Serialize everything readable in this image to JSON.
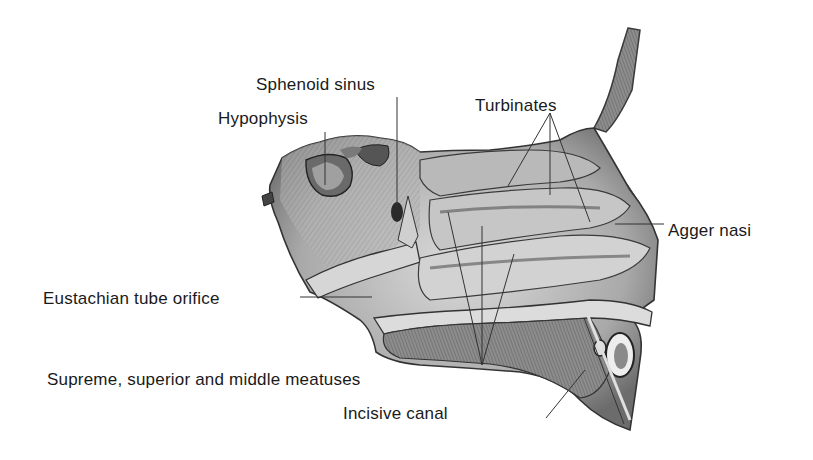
{
  "figure": {
    "labels": {
      "sphenoid_sinus": "Sphenoid sinus",
      "hypophysis": "Hypophysis",
      "turbinates": "Turbinates",
      "agger_nasi": "Agger nasi",
      "eustachian_tube_orifice": "Eustachian tube orifice",
      "meatuses": "Supreme, superior and middle meatuses",
      "incisive_canal": "Incisive canal"
    },
    "colors": {
      "background": "#ffffff",
      "text": "#1a1a1a",
      "leader_line": "#333333",
      "tissue_light": "#d9d9d9",
      "tissue_mid": "#9a9a9a",
      "tissue_dark": "#4a4a4a"
    }
  }
}
